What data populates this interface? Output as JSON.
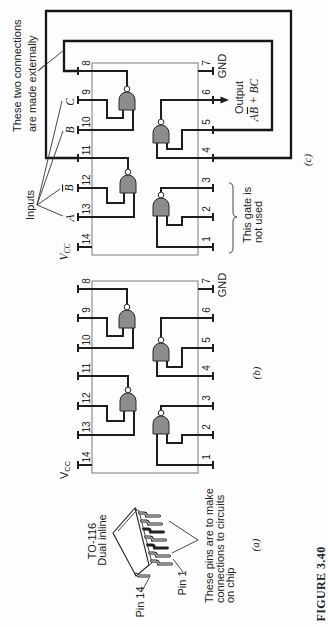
{
  "figure": {
    "caption": "FIGURE 3.40"
  },
  "panel_a": {
    "label": "(a)",
    "package_name": "TO-116",
    "package_type": "Dual inline",
    "pin14_label": "Pin 14",
    "pin1_label": "Pin 1",
    "pins_note": [
      "These pins are to make",
      "connections to circuits",
      "on chip"
    ]
  },
  "panel_b": {
    "label": "(b)",
    "vcc": {
      "main": "V",
      "sub": "CC"
    },
    "gnd": "GND",
    "pins_left": [
      "8",
      "9",
      "10",
      "11",
      "12",
      "13",
      "14"
    ],
    "pins_right": [
      "7",
      "6",
      "5",
      "4",
      "3",
      "2",
      "1"
    ]
  },
  "panel_c": {
    "label": "(c)",
    "external_note": [
      "These two connections",
      "are made externally"
    ],
    "inputs_label": "Inputs",
    "inputs": [
      {
        "text": "C"
      },
      {
        "text": "B"
      },
      {
        "text": "B",
        "overbar": true
      },
      {
        "text": "A"
      }
    ],
    "vcc": {
      "main": "V",
      "sub": "CC"
    },
    "gnd": "GND",
    "output_label": "Output",
    "output_expression": {
      "a": "A",
      "b_bar": "B",
      "rest": " + BC"
    },
    "unused_note": [
      "This gate is",
      "not used"
    ],
    "pins_left": [
      "8",
      "9",
      "10",
      "11",
      "12",
      "13",
      "14"
    ],
    "pins_right": [
      "7",
      "6",
      "5",
      "4",
      "3",
      "2",
      "1"
    ]
  },
  "colors": {
    "gate_fill": "#8d8d8d",
    "wire": "#1e1e1e",
    "background": "#fdfdfd"
  }
}
